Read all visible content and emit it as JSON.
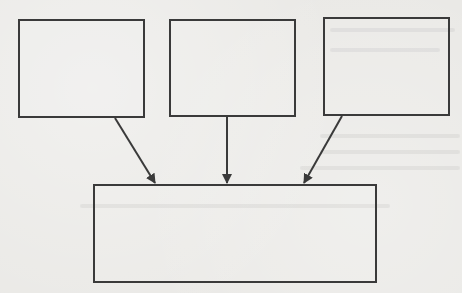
{
  "diagram": {
    "type": "flow-many-to-one",
    "colors": {
      "line": "#3a3a3a",
      "paper": "#eae9e6"
    },
    "top_boxes": [
      {
        "id": "box-1",
        "label": "",
        "x": 18,
        "y": 19,
        "w": 127,
        "h": 99
      },
      {
        "id": "box-2",
        "label": "",
        "x": 169,
        "y": 19,
        "w": 127,
        "h": 98
      },
      {
        "id": "box-3",
        "label": "",
        "x": 323,
        "y": 17,
        "w": 127,
        "h": 99
      }
    ],
    "bottom_box": {
      "id": "box-result",
      "label": "",
      "x": 93,
      "y": 184,
      "w": 284,
      "h": 99
    },
    "arrows": [
      {
        "from": "box-1",
        "to": "box-result",
        "x1": 115,
        "y1": 118,
        "x2": 155,
        "y2": 183
      },
      {
        "from": "box-2",
        "to": "box-result",
        "x1": 227,
        "y1": 117,
        "x2": 227,
        "y2": 183
      },
      {
        "from": "box-3",
        "to": "box-result",
        "x1": 342,
        "y1": 116,
        "x2": 304,
        "y2": 183
      }
    ]
  }
}
